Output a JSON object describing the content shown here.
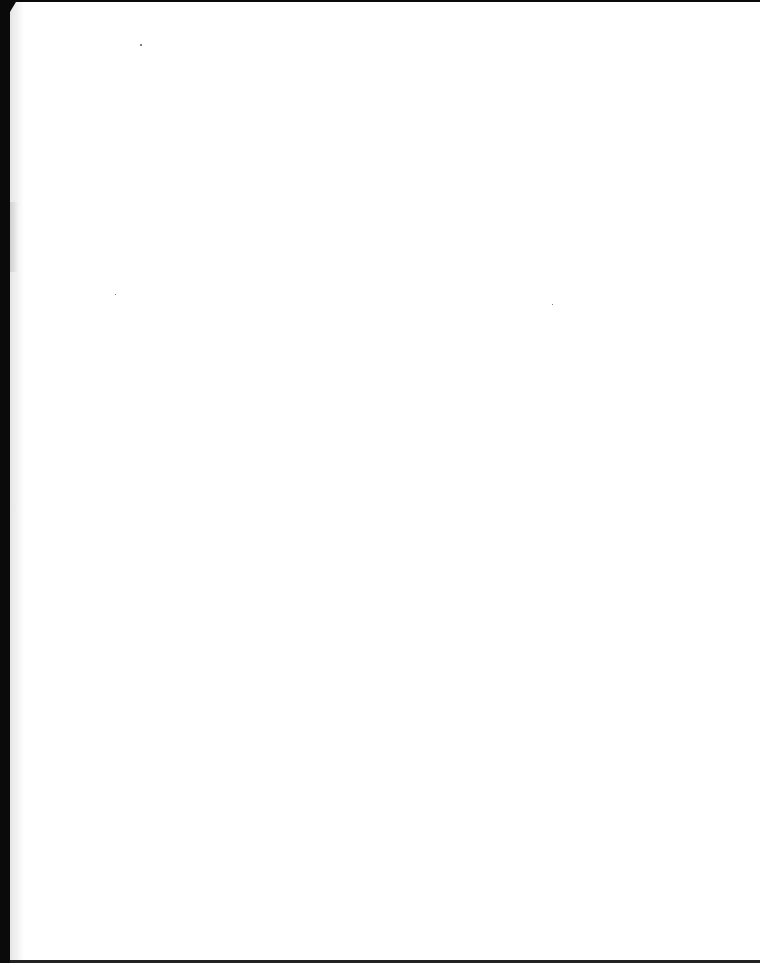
{
  "document": {
    "type": "scanned-blank-page",
    "text": ""
  },
  "colors": {
    "paper": "#ffffff",
    "scanner_bed": "#0a0a0a"
  }
}
